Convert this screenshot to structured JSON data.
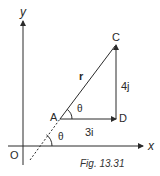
{
  "figure": {
    "caption": "Fig. 13.31",
    "axes": {
      "x_label": "x",
      "y_label": "y",
      "origin_label": "O"
    },
    "points": {
      "A": "A",
      "C": "C",
      "D": "D"
    },
    "vectors": {
      "r_label": "r",
      "horizontal_label": "3i",
      "vertical_label": "4j"
    },
    "angles": {
      "angle_at_A": "θ",
      "angle_at_x_axis": "θ"
    },
    "colors": {
      "stroke": "#2a2a2a",
      "background": "#ffffff"
    }
  }
}
